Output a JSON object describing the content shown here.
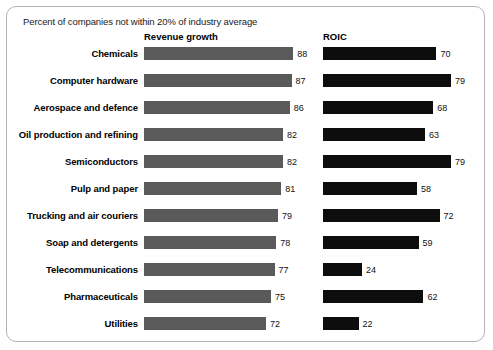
{
  "exhibit": {
    "subtitle": "Percent of companies not within 20% of industry average"
  },
  "columns": {
    "revenue_header": "Revenue growth",
    "roic_header": "ROIC"
  },
  "colors": {
    "revenue_bar": "#5a5a5a",
    "roic_bar": "#0d0d0d",
    "frame": "#b4b4b4",
    "background": "#ffffff"
  },
  "chart_data": {
    "type": "bar",
    "title": "Percent of companies not within 20% of industry average",
    "xlabel": "",
    "ylabel": "",
    "orientation": "horizontal",
    "grid": false,
    "legend_position": "top (column headers)",
    "xlim": [
      0,
      88
    ],
    "categories": [
      "Chemicals",
      "Computer hardware",
      "Aerospace and defence",
      "Oil production and refining",
      "Semiconductors",
      "Pulp and paper",
      "Trucking and air couriers",
      "Soap and detergents",
      "Telecommunications",
      "Pharmaceuticals",
      "Utilities"
    ],
    "series": [
      {
        "name": "Revenue growth",
        "values": [
          88,
          87,
          86,
          82,
          82,
          81,
          79,
          78,
          77,
          75,
          72
        ]
      },
      {
        "name": "ROIC",
        "values": [
          70,
          79,
          68,
          63,
          79,
          58,
          72,
          59,
          24,
          62,
          22
        ]
      }
    ]
  }
}
